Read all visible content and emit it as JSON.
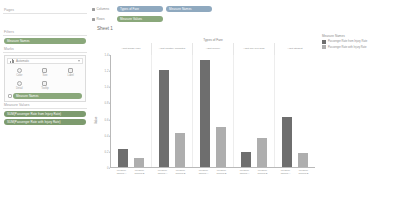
{
  "left_panel": {
    "pages": {
      "label": "Pages"
    },
    "filters": {
      "label": "Filters",
      "pills": [
        {
          "name": "Measure Names"
        }
      ]
    },
    "marks": {
      "label": "Marks",
      "type_selector": {
        "value": "Automatic",
        "icon": "bar-chart-icon"
      },
      "buttons": [
        {
          "label": "Color",
          "icon": "color-icon"
        },
        {
          "label": "Size",
          "icon": "size-icon"
        },
        {
          "label": "Label",
          "icon": "label-icon"
        },
        {
          "label": "Detail",
          "icon": "detail-icon"
        },
        {
          "label": "Tooltip",
          "icon": "tooltip-icon"
        }
      ],
      "field_pills": [
        {
          "name": "Measure Names"
        }
      ]
    },
    "measure_values": {
      "label": "Measure Values",
      "pills": [
        {
          "name": "SUM(Passenger Rate from Injury Rate)"
        },
        {
          "name": "SUM(Passenger Rate with Injury Rate)"
        }
      ]
    }
  },
  "shelves": [
    {
      "name": "Columns",
      "pills": [
        {
          "name": "Types of Fare",
          "color": "blue"
        },
        {
          "name": "Measure Names",
          "color": "blue"
        }
      ]
    },
    {
      "name": "Rows",
      "pills": [
        {
          "name": "Measure Values",
          "color": "green"
        }
      ]
    }
  ],
  "sheet": {
    "title": "Sheet 1"
  },
  "legend": {
    "title": "Measure Names",
    "entries": [
      {
        "label": "Passenger Rate from Injury Rate",
        "color": "#6e6e6e"
      },
      {
        "label": "Passenger Rate with Injury Rate",
        "color": "#aeaeae"
      }
    ]
  },
  "chart_data": {
    "type": "bar",
    "title": "Types of Fare",
    "xlabel": "Types of Fare",
    "ylabel": "Value",
    "ylim": [
      0,
      1.4
    ],
    "grid": false,
    "legend_position": "right",
    "ytick_labels": [
      "1.4",
      "1.2",
      "1.0",
      "0.8",
      "0.6",
      "0.4",
      "0.2",
      "0"
    ],
    "ytick_values": [
      1.4,
      1.2,
      1.0,
      0.8,
      0.6,
      0.4,
      0.2,
      0
    ],
    "categories": [
      "Adult Single Fare",
      "Adult Monthly Unlimited",
      "Adult Weekly",
      "Adult Pay-Per-Ride",
      "Adult Student"
    ],
    "series": [
      {
        "name": "Passenger Rate from Injury Rate",
        "color": "#6e6e6e",
        "values": [
          0.22,
          1.2,
          1.33,
          0.19,
          0.62
        ]
      },
      {
        "name": "Passenger Rate with Injury Rate",
        "color": "#aeaeae",
        "values": [
          0.11,
          0.42,
          0.5,
          0.36,
          0.17
        ]
      }
    ],
    "bar_labels": [
      [
        "Measure Names A",
        "Measure Names B"
      ],
      [
        "Measure Names A",
        "Measure Names B"
      ],
      [
        "Measure Names A",
        "Measure Names B"
      ],
      [
        "Measure Names A",
        "Measure Names B"
      ],
      [
        "Measure Names A",
        "Measure Names B"
      ]
    ]
  }
}
